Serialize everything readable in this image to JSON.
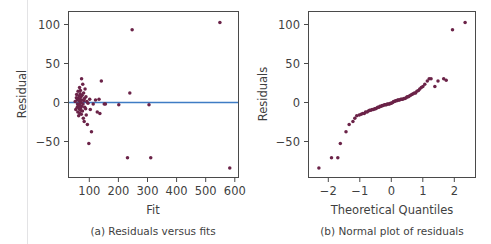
{
  "figure": {
    "background": "#ffffff",
    "point_color": "#6B2348",
    "line_color": "#3E7CC4",
    "axis_color": "#4a4a4a",
    "text_color": "#3f3f3f"
  },
  "panels": [
    {
      "id": "panel-a",
      "caption": "(a) Residuals versus fits"
    },
    {
      "id": "panel-b",
      "caption": "(b) Normal plot of residuals"
    }
  ],
  "chart_data": [
    {
      "type": "scatter",
      "title": "",
      "subtitle": "",
      "caption": "(a) Residuals versus fits",
      "xlabel": "Fit",
      "ylabel": "Residual",
      "xlim": [
        25,
        610
      ],
      "ylim": [
        -92,
        118
      ],
      "xticks": [
        100,
        200,
        300,
        400,
        500,
        600
      ],
      "xticklabels": [
        "100",
        "200",
        "300",
        "400",
        "500",
        "600"
      ],
      "yticks": [
        -50,
        0,
        50,
        100
      ],
      "yticklabels": [
        "−50",
        "0",
        "50",
        "100"
      ],
      "grid": false,
      "legend": null,
      "marker_color": "#6B2348",
      "reference_line": {
        "type": "horizontal",
        "y": 0,
        "color": "#3E7CC4",
        "label": "zero residual line"
      },
      "x": [
        48,
        50,
        52,
        53,
        55,
        55,
        56,
        57,
        58,
        58,
        59,
        60,
        60,
        61,
        62,
        62,
        63,
        63,
        64,
        64,
        65,
        65,
        66,
        66,
        67,
        68,
        68,
        69,
        70,
        70,
        71,
        72,
        73,
        74,
        75,
        76,
        77,
        78,
        79,
        80,
        81,
        82,
        84,
        85,
        86,
        88,
        90,
        92,
        95,
        98,
        100,
        104,
        110,
        118,
        124,
        130,
        133,
        138,
        148,
        152,
        198,
        228,
        236,
        244,
        302,
        308,
        546,
        580
      ],
      "y": [
        4,
        -6,
        9,
        13,
        -3,
        6,
        1,
        -9,
        17,
        -2,
        8,
        0,
        -14,
        11,
        5,
        -5,
        22,
        -1,
        7,
        -11,
        14,
        2,
        -7,
        18,
        -4,
        10,
        3,
        -12,
        6,
        33,
        -2,
        12,
        -8,
        26,
        1,
        -17,
        15,
        5,
        -21,
        8,
        -3,
        20,
        -5,
        10,
        -13,
        4,
        -25,
        2,
        -49,
        7,
        -6,
        -34,
        1,
        6,
        -9,
        7,
        -11,
        30,
        1,
        1,
        0,
        -67,
        15,
        95,
        0,
        -67,
        104,
        -80
      ]
    },
    {
      "type": "scatter",
      "title": "",
      "subtitle": "",
      "caption": "(b) Normal plot of residuals",
      "xlabel": "Theoretical Quantiles",
      "ylabel": "Residuals",
      "xlim": [
        -2.65,
        2.65
      ],
      "ylim": [
        -92,
        118
      ],
      "xticks": [
        -2,
        -1,
        0,
        1,
        2
      ],
      "xticklabels": [
        "−2",
        "−1",
        "0",
        "1",
        "2"
      ],
      "yticks": [
        -50,
        0,
        50,
        100
      ],
      "yticklabels": [
        "−50",
        "0",
        "50",
        "100"
      ],
      "grid": false,
      "legend": null,
      "marker_color": "#6B2348",
      "x": [
        -2.32,
        -1.92,
        -1.72,
        -1.64,
        -1.46,
        -1.36,
        -1.24,
        -1.18,
        -1.12,
        -1.04,
        -0.98,
        -0.93,
        -0.88,
        -0.84,
        -0.79,
        -0.75,
        -0.71,
        -0.67,
        -0.63,
        -0.59,
        -0.55,
        -0.52,
        -0.48,
        -0.45,
        -0.41,
        -0.38,
        -0.34,
        -0.31,
        -0.28,
        -0.24,
        -0.21,
        -0.18,
        -0.15,
        -0.11,
        -0.08,
        -0.05,
        -0.02,
        0.02,
        0.05,
        0.08,
        0.11,
        0.15,
        0.18,
        0.21,
        0.24,
        0.28,
        0.31,
        0.34,
        0.38,
        0.41,
        0.45,
        0.48,
        0.52,
        0.55,
        0.59,
        0.63,
        0.67,
        0.71,
        0.75,
        0.79,
        0.84,
        0.88,
        0.93,
        0.98,
        1.04,
        1.12,
        1.18,
        1.24,
        1.36,
        1.46,
        1.64,
        1.72,
        1.92,
        2.32
      ],
      "y": [
        -80,
        -67,
        -67,
        -49,
        -34,
        -25,
        -21,
        -17,
        -14,
        -13,
        -12,
        -11,
        -11,
        -9,
        -9,
        -8,
        -7,
        -7,
        -6,
        -6,
        -5,
        -5,
        -4,
        -3,
        -3,
        -2,
        -2,
        -1,
        -1,
        0,
        0,
        0,
        1,
        1,
        1,
        2,
        2,
        3,
        4,
        4,
        5,
        5,
        6,
        6,
        6,
        7,
        7,
        7,
        8,
        8,
        9,
        10,
        10,
        11,
        12,
        13,
        14,
        15,
        15,
        17,
        18,
        20,
        22,
        23,
        26,
        30,
        33,
        33,
        23,
        30,
        33,
        31,
        95,
        104
      ]
    }
  ]
}
